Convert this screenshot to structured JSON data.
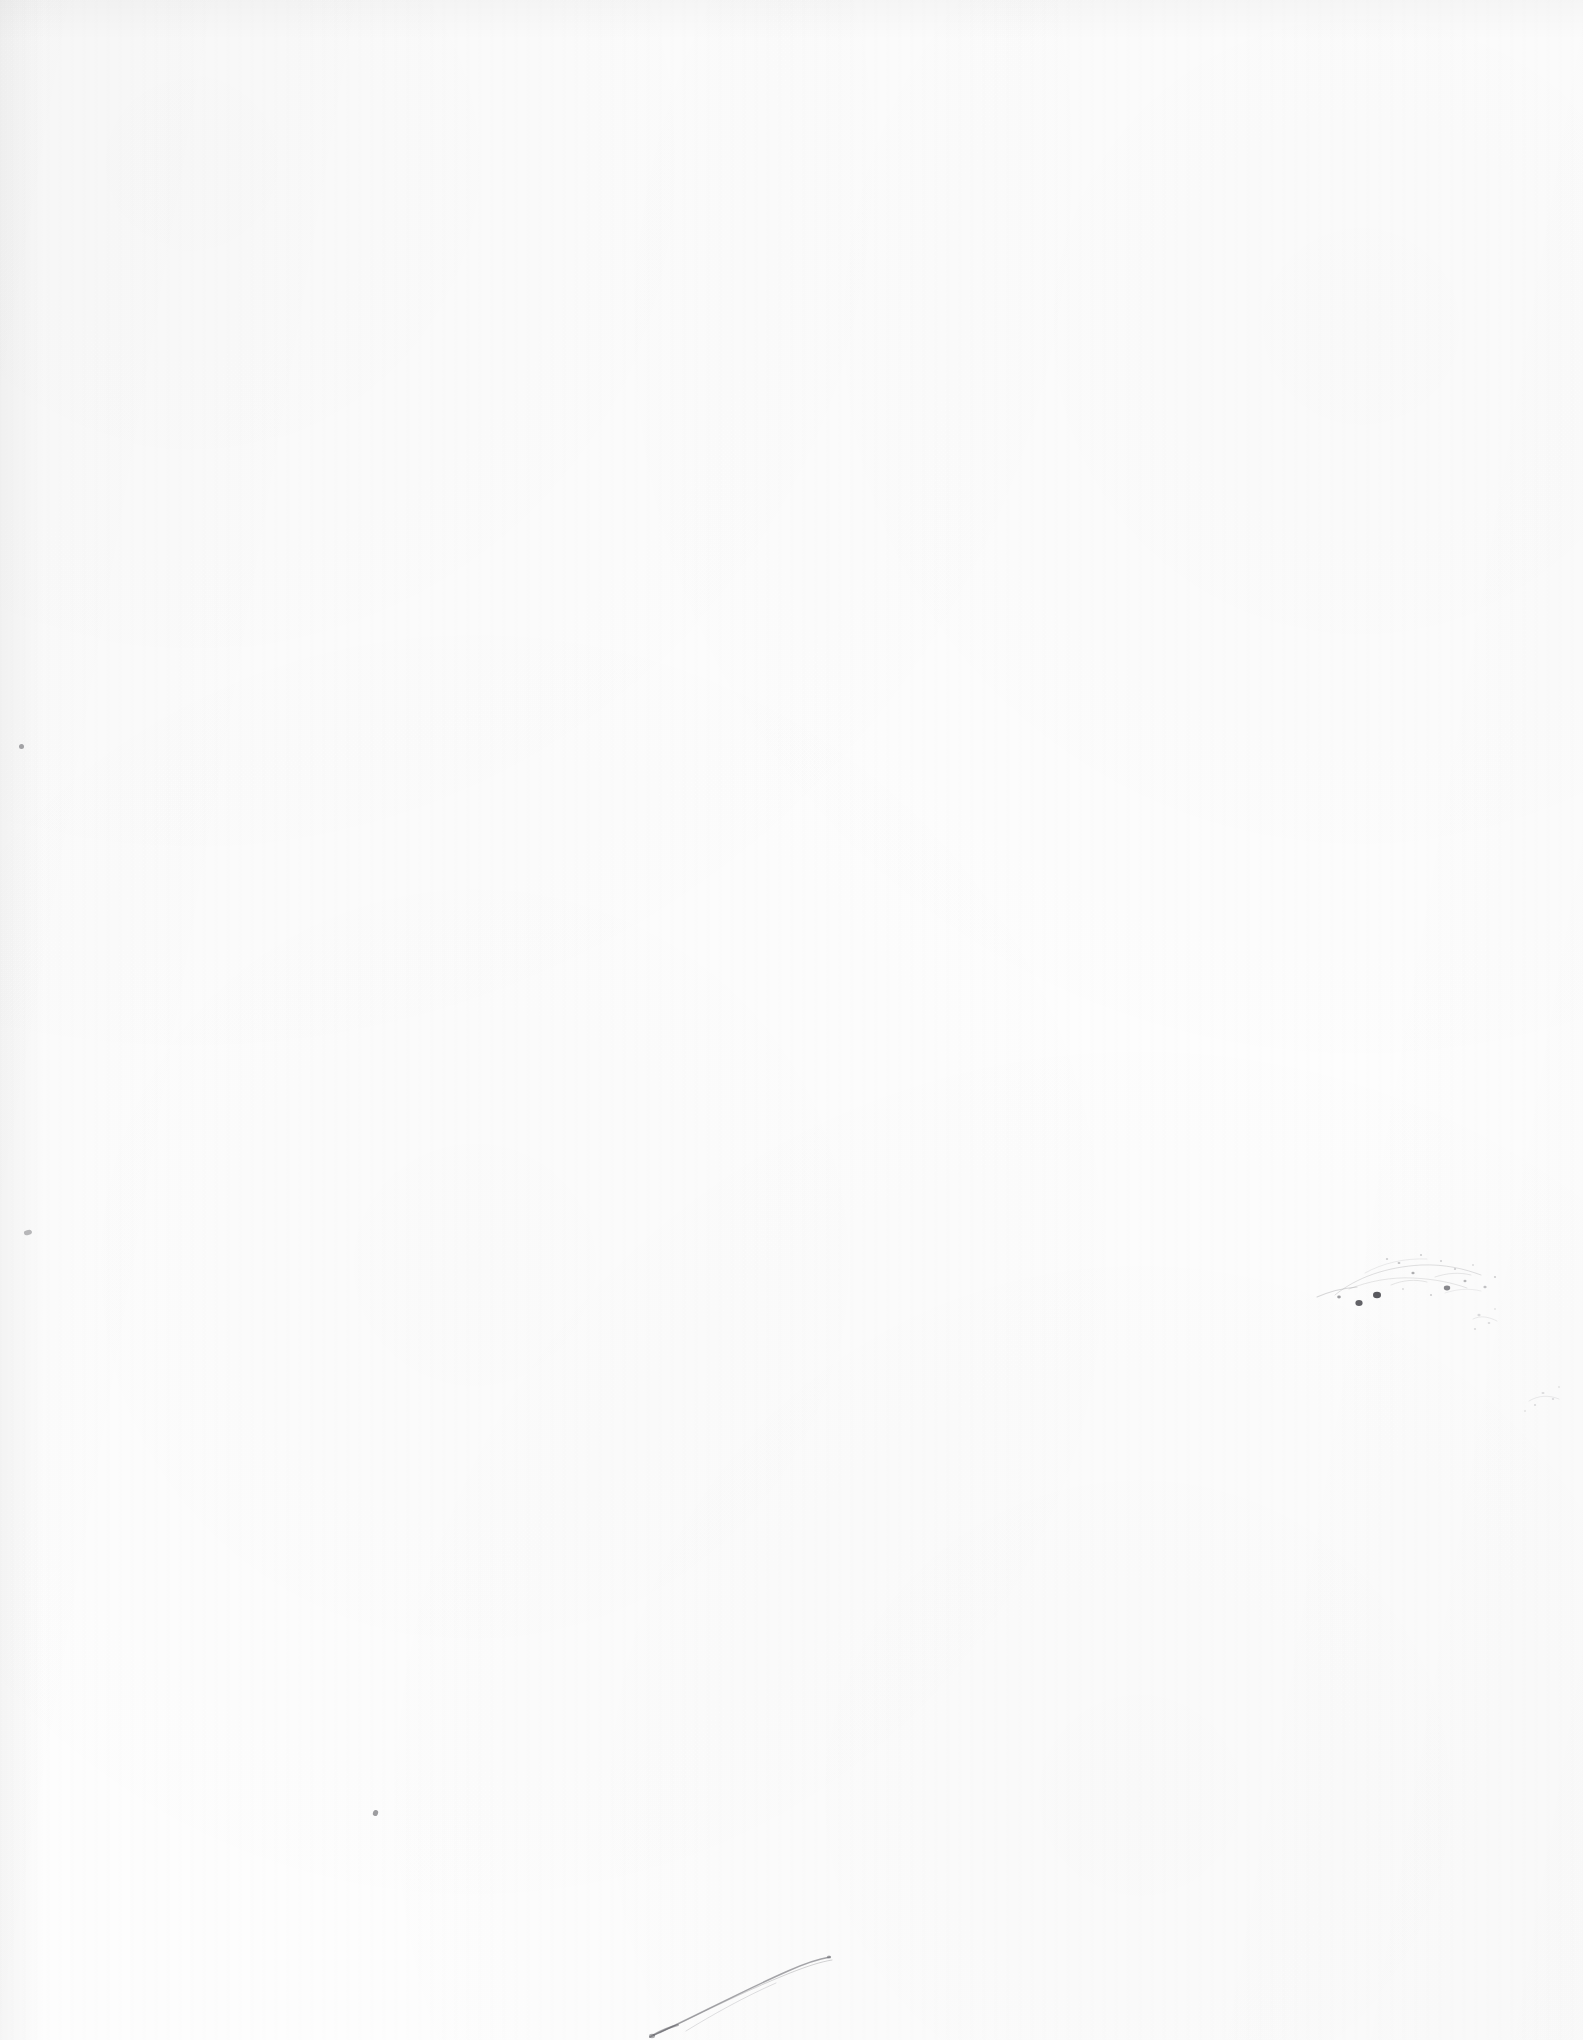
{
  "page": {
    "kind": "blank-scanned-page",
    "width": 1583,
    "height": 2040,
    "background_color": "#fdfdfd",
    "paper_tone": "#fdfdfd",
    "ink_color": "#5d5d62",
    "visible_text": "",
    "artifacts": [
      {
        "name": "edge-speck-left-upper",
        "type": "speck",
        "x": 21,
        "y": 746,
        "size": 4,
        "opacity": 0.55
      },
      {
        "name": "edge-speck-left-lower",
        "type": "speck",
        "x": 27,
        "y": 1233,
        "size": 6,
        "opacity": 0.45
      },
      {
        "name": "speck-lower-left",
        "type": "speck",
        "x": 375,
        "y": 1812,
        "size": 4,
        "opacity": 0.6
      },
      {
        "name": "ink-smudge-cluster",
        "type": "smudge",
        "x": 1320,
        "y": 1245,
        "width": 200,
        "height": 80,
        "opacity": 0.32
      },
      {
        "name": "curved-scratch",
        "type": "scratch",
        "x": 650,
        "y": 1960,
        "width": 180,
        "height": 80,
        "opacity": 0.4
      },
      {
        "name": "corner-flecks-right",
        "type": "flecks",
        "x": 1470,
        "y": 1300,
        "width": 113,
        "height": 120,
        "opacity": 0.18
      }
    ]
  }
}
